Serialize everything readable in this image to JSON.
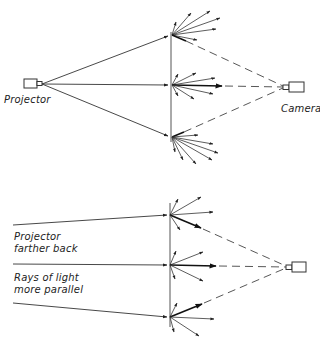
{
  "figure": {
    "colors": {
      "ink": "#222222",
      "background": "#ffffff"
    }
  },
  "top_diagram": {
    "projector_label": "Projector",
    "camera_label": "Camera",
    "projector": {
      "x": 42,
      "y": 84
    },
    "camera": {
      "x": 283,
      "y": 87
    },
    "screen": {
      "x": 171,
      "y_top": 32,
      "y_bottom": 142
    },
    "hit_points": [
      {
        "x": 172,
        "y": 35
      },
      {
        "x": 172,
        "y": 85
      },
      {
        "x": 172,
        "y": 137
      }
    ]
  },
  "bottom_diagram": {
    "label_projector_line1": "Projector",
    "label_projector_line2": "farther back",
    "label_rays_line1": "Rays of light",
    "label_rays_line2": "more parallel",
    "camera": {
      "x": 286,
      "y": 267
    },
    "screen": {
      "x": 170,
      "y_top": 203,
      "y_bottom": 327
    },
    "incoming_rays": [
      {
        "from": [
          13,
          225
        ],
        "to": [
          170,
          215
        ]
      },
      {
        "from": [
          13,
          264
        ],
        "to": [
          170,
          265
        ]
      },
      {
        "from": [
          13,
          303
        ],
        "to": [
          170,
          317
        ]
      }
    ]
  }
}
